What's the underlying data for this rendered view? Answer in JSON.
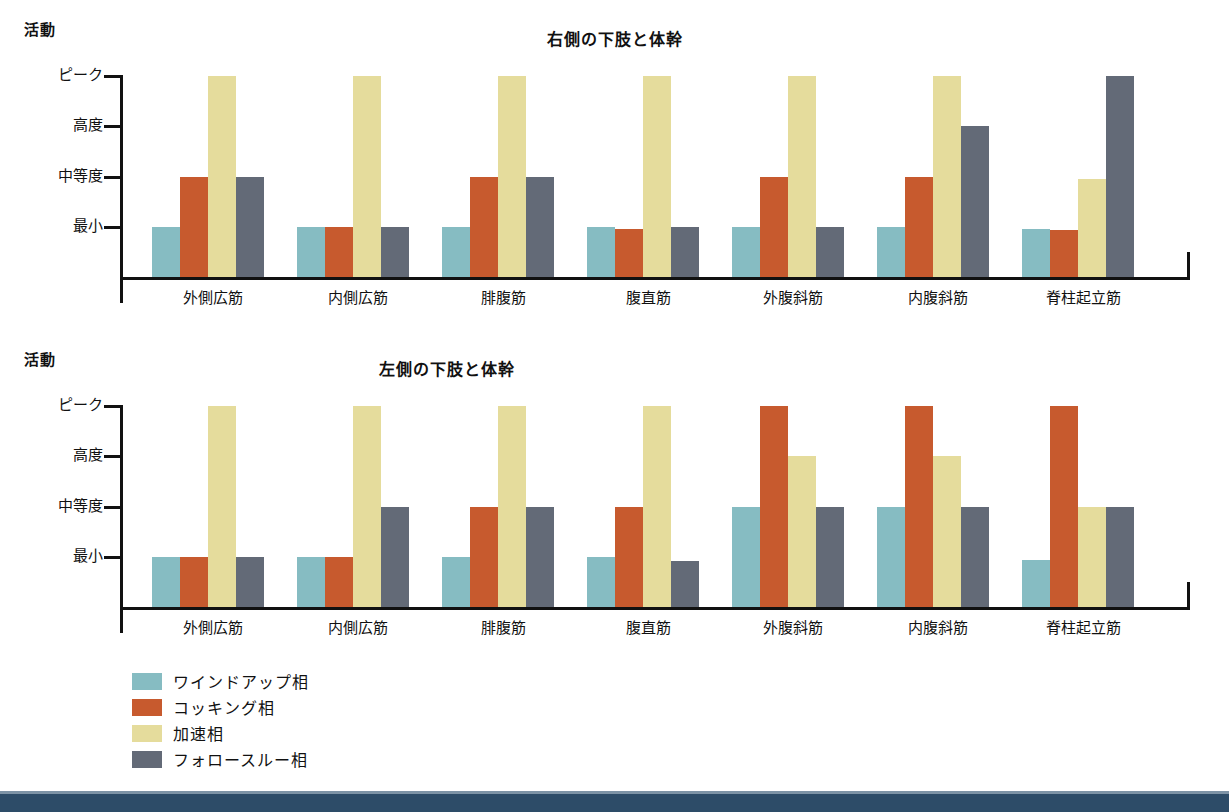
{
  "axis_name": "活動",
  "y_labels": [
    "ピーク",
    "高度",
    "中等度",
    "最小"
  ],
  "categories": [
    "外側広筋",
    "内側広筋",
    "腓腹筋",
    "腹直筋",
    "外腹斜筋",
    "内腹斜筋",
    "脊柱起立筋"
  ],
  "legend": [
    {
      "label": "ワインドアップ相",
      "color": "#86bcc2"
    },
    {
      "label": "コッキング相",
      "color": "#c75a2e"
    },
    {
      "label": "加速相",
      "color": "#e5dc9c"
    },
    {
      "label": "フォロースルー相",
      "color": "#636a77"
    }
  ],
  "colors": {
    "windup": "#86bcc2",
    "cocking": "#c75a2e",
    "acceleration": "#e5dc9c",
    "followthrough": "#636a77",
    "axis": "#111111",
    "banner": "#2d4c68"
  },
  "charts": [
    {
      "id": "chart1",
      "title": "右側の下肢と体幹"
    },
    {
      "id": "chart2",
      "title": "左側の下肢と体幹"
    }
  ],
  "chart_data": [
    {
      "type": "bar",
      "title": "右側の下肢と体幹",
      "xlabel": "",
      "ylabel": "活動",
      "grid": false,
      "legend_position": "bottom-left",
      "ytick_labels": [
        "最小",
        "中等度",
        "高度",
        "ピーク"
      ],
      "ytick_values": [
        1,
        2,
        3,
        4
      ],
      "ylim": [
        0,
        4
      ],
      "categories": [
        "外側広筋",
        "内側広筋",
        "腓腹筋",
        "腹直筋",
        "外腹斜筋",
        "内腹斜筋",
        "脊柱起立筋"
      ],
      "series": [
        {
          "name": "ワインドアップ相",
          "color": "#86bcc2",
          "values": [
            1,
            1,
            1,
            1,
            1,
            1,
            0.95
          ]
        },
        {
          "name": "コッキング相",
          "color": "#c75a2e",
          "values": [
            2,
            1,
            2,
            0.95,
            2,
            2,
            0.93
          ]
        },
        {
          "name": "加速相",
          "color": "#e5dc9c",
          "values": [
            4,
            4,
            4,
            4,
            4,
            4,
            1.95
          ]
        },
        {
          "name": "フォロースルー相",
          "color": "#636a77",
          "values": [
            2,
            1,
            2,
            1,
            1,
            3,
            4
          ]
        }
      ]
    },
    {
      "type": "bar",
      "title": "左側の下肢と体幹",
      "xlabel": "",
      "ylabel": "活動",
      "grid": false,
      "legend_position": "bottom-left",
      "ytick_labels": [
        "最小",
        "中等度",
        "高度",
        "ピーク"
      ],
      "ytick_values": [
        1,
        2,
        3,
        4
      ],
      "ylim": [
        0,
        4
      ],
      "categories": [
        "外側広筋",
        "内側広筋",
        "腓腹筋",
        "腹直筋",
        "外腹斜筋",
        "内腹斜筋",
        "脊柱起立筋"
      ],
      "series": [
        {
          "name": "ワインドアップ相",
          "color": "#86bcc2",
          "values": [
            1,
            1,
            1,
            1,
            2,
            2,
            0.93
          ]
        },
        {
          "name": "コッキング相",
          "color": "#c75a2e",
          "values": [
            1,
            1,
            2,
            2,
            4,
            4,
            4
          ]
        },
        {
          "name": "加速相",
          "color": "#e5dc9c",
          "values": [
            4,
            4,
            4,
            4,
            3,
            3,
            2
          ]
        },
        {
          "name": "フォロースルー相",
          "color": "#636a77",
          "values": [
            1,
            2,
            2,
            0.92,
            2,
            2,
            2
          ]
        }
      ]
    }
  ]
}
